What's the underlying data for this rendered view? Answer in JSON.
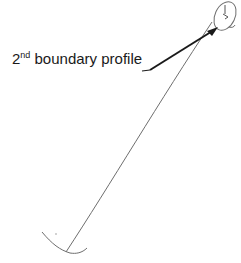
{
  "diagram": {
    "label": {
      "ordinal_number": "2",
      "ordinal_suffix": "nd",
      "text": " boundary profile"
    },
    "colors": {
      "profile_line": "#6e6e6e",
      "arrow": "#1a1a1a",
      "text": "#1a1a1a",
      "background": "#ffffff"
    }
  }
}
